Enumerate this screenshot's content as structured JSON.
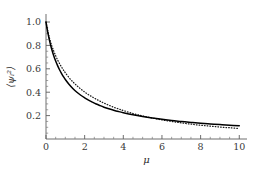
{
  "chart_data": {
    "type": "line",
    "title": "",
    "subtitle": "",
    "xlabel": "μ",
    "ylabel": "⟨ψᵢ²⟩",
    "xlim": [
      0,
      10.4
    ],
    "ylim": [
      0,
      1.06
    ],
    "grid": false,
    "legend": "none",
    "frame": "left-bottom-spines-only",
    "background_color": "#ffffff",
    "axis_color": "#5e5e5e",
    "xticks": [
      0,
      2,
      4,
      6,
      8,
      10
    ],
    "xtick_labels": [
      "0",
      "2",
      "4",
      "6",
      "8",
      "10"
    ],
    "x_minor_tick_step": 0.5,
    "yticks": [
      0.2,
      0.4,
      0.6,
      0.8,
      1.0
    ],
    "ytick_labels": [
      "0.2",
      "0.4",
      "0.6",
      "0.8",
      "1.0"
    ],
    "y_minor_tick_step": 0.05,
    "annotations": [],
    "x": [
      0,
      0.1,
      0.2,
      0.3,
      0.4,
      0.5,
      0.6,
      0.7,
      0.8,
      0.9,
      1.0,
      1.2,
      1.4,
      1.6,
      1.8,
      2.0,
      2.2,
      2.4,
      2.6,
      2.8,
      3.0,
      3.25,
      3.5,
      3.75,
      4.0,
      4.5,
      5.0,
      5.5,
      6.0,
      6.5,
      7.0,
      7.5,
      8.0,
      8.5,
      9.0,
      9.5,
      10.0
    ],
    "series": [
      {
        "name": "solid-curve",
        "style": "solid",
        "color": "#000000",
        "values": [
          1.0,
          0.905,
          0.828,
          0.765,
          0.712,
          0.666,
          0.627,
          0.592,
          0.561,
          0.534,
          0.509,
          0.466,
          0.43,
          0.4,
          0.374,
          0.352,
          0.332,
          0.315,
          0.299,
          0.285,
          0.272,
          0.258,
          0.246,
          0.235,
          0.225,
          0.207,
          0.192,
          0.179,
          0.168,
          0.158,
          0.15,
          0.142,
          0.135,
          0.129,
          0.123,
          0.118,
          0.113
        ]
      },
      {
        "name": "dotted-curve",
        "style": "dotted",
        "color": "#1a1a1a",
        "values": [
          1.0,
          0.918,
          0.851,
          0.797,
          0.752,
          0.712,
          0.676,
          0.645,
          0.616,
          0.59,
          0.566,
          0.523,
          0.487,
          0.455,
          0.427,
          0.402,
          0.379,
          0.359,
          0.34,
          0.323,
          0.307,
          0.289,
          0.272,
          0.257,
          0.243,
          0.218,
          0.197,
          0.179,
          0.163,
          0.15,
          0.138,
          0.127,
          0.118,
          0.11,
          0.102,
          0.096,
          0.09
        ]
      }
    ]
  }
}
